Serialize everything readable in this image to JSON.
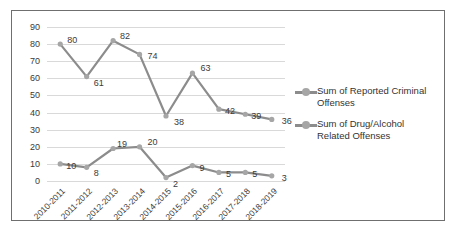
{
  "chart_data": {
    "type": "line",
    "title": "",
    "xlabel": "",
    "ylabel": "",
    "ylim": [
      0,
      90
    ],
    "y_ticks": [
      0,
      10,
      20,
      30,
      40,
      50,
      60,
      70,
      80,
      90
    ],
    "grid": true,
    "legend_position": "right",
    "categories": [
      "2010-2011",
      "2011-2012",
      "2012-2013",
      "2013-2014",
      "2014-2015",
      "2015-2016",
      "2016-2017",
      "2017-2018",
      "2018-2019"
    ],
    "series": [
      {
        "name": "Sum of Reported Criminal Offenses",
        "color": "#8c8c8c",
        "values": [
          80,
          61,
          82,
          74,
          38,
          63,
          42,
          39,
          36
        ]
      },
      {
        "name": "Sum of Drug/Alcohol Related Offenses",
        "color": "#8c8c8c",
        "values": [
          10,
          8,
          19,
          20,
          2,
          9,
          5,
          5,
          3
        ]
      }
    ]
  },
  "legend": {
    "entries": [
      {
        "label": "Sum of Reported Criminal Offenses"
      },
      {
        "label": "Sum of Drug/Alcohol Related Offenses"
      }
    ]
  }
}
